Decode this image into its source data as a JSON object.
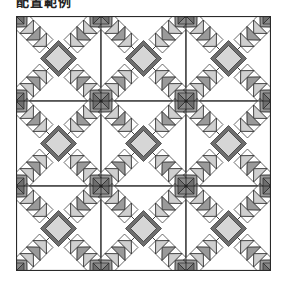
{
  "title": "配置範例",
  "quilt": {
    "rows": 3,
    "cols": 3,
    "block_size": 85,
    "colors": {
      "background": "#f7f7f7",
      "light": "#ffffff",
      "medium": "#9a9a9a",
      "pale": "#cfcfcf",
      "dark": "#6e6e6e",
      "outline": "#2a2a2a",
      "center": "#d6d6d6",
      "junction": "#8a8a8a"
    }
  }
}
